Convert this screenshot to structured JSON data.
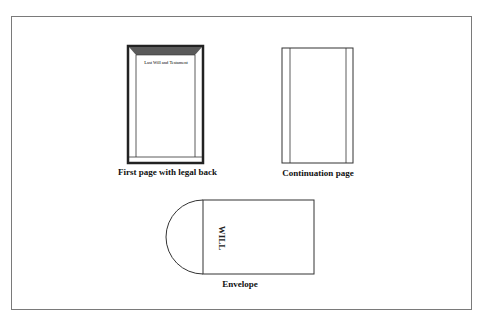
{
  "diagram": {
    "first_page": {
      "caption": "First page with legal back",
      "title_text": "Last Will and Testament"
    },
    "continuation_page": {
      "caption": "Continuation page"
    },
    "envelope": {
      "caption": "Envelope",
      "label": "WILL"
    },
    "colors": {
      "frame": "#7a7a7a",
      "line": "#333333",
      "legal_back_band": "#5a5a5a"
    }
  }
}
